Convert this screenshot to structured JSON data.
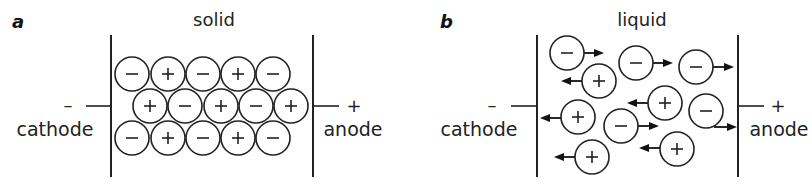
{
  "panels": [
    {
      "id": "a",
      "label": "a",
      "title": "solid",
      "left_terminal": {
        "sign": "–",
        "name": "cathode"
      },
      "right_terminal": {
        "sign": "+",
        "name": "anode"
      },
      "geometry": {
        "left_wall_x": 111,
        "right_wall_x": 313,
        "wall_top": 35,
        "wall_bottom": 177,
        "lead_y": 106
      },
      "ions": [
        {
          "charge": "-",
          "x": 132,
          "y": 74
        },
        {
          "charge": "+",
          "x": 168,
          "y": 74
        },
        {
          "charge": "-",
          "x": 203,
          "y": 74
        },
        {
          "charge": "+",
          "x": 238,
          "y": 74
        },
        {
          "charge": "-",
          "x": 273,
          "y": 74
        },
        {
          "charge": "+",
          "x": 150,
          "y": 106
        },
        {
          "charge": "-",
          "x": 185,
          "y": 106
        },
        {
          "charge": "+",
          "x": 221,
          "y": 106
        },
        {
          "charge": "-",
          "x": 256,
          "y": 106
        },
        {
          "charge": "+",
          "x": 291,
          "y": 106
        },
        {
          "charge": "-",
          "x": 132,
          "y": 138
        },
        {
          "charge": "+",
          "x": 168,
          "y": 138
        },
        {
          "charge": "-",
          "x": 203,
          "y": 138
        },
        {
          "charge": "+",
          "x": 238,
          "y": 138
        },
        {
          "charge": "-",
          "x": 273,
          "y": 138
        }
      ]
    },
    {
      "id": "b",
      "label": "b",
      "title": "liquid",
      "left_terminal": {
        "sign": "–",
        "name": "cathode"
      },
      "right_terminal": {
        "sign": "+",
        "name": "anode"
      },
      "geometry": {
        "left_wall_x": 537,
        "right_wall_x": 738,
        "wall_top": 35,
        "wall_bottom": 177,
        "lead_y": 106
      },
      "ions": [
        {
          "charge": "-",
          "x": 567,
          "y": 53,
          "arrow": {
            "x1": 584,
            "y1": 53,
            "x2": 604,
            "y2": 53
          }
        },
        {
          "charge": "+",
          "x": 599,
          "y": 81,
          "arrow": {
            "x1": 582,
            "y1": 81,
            "x2": 561,
            "y2": 81
          }
        },
        {
          "charge": "-",
          "x": 636,
          "y": 63,
          "arrow": {
            "x1": 653,
            "y1": 63,
            "x2": 673,
            "y2": 63
          }
        },
        {
          "charge": "-",
          "x": 696,
          "y": 67,
          "arrow": {
            "x1": 713,
            "y1": 67,
            "x2": 734,
            "y2": 67
          }
        },
        {
          "charge": "+",
          "x": 665,
          "y": 103,
          "arrow": {
            "x1": 648,
            "y1": 103,
            "x2": 627,
            "y2": 103
          }
        },
        {
          "charge": "+",
          "x": 578,
          "y": 117,
          "arrow": {
            "x1": 561,
            "y1": 118,
            "x2": 540,
            "y2": 118
          }
        },
        {
          "charge": "-",
          "x": 621,
          "y": 126,
          "arrow": {
            "x1": 638,
            "y1": 126,
            "x2": 659,
            "y2": 126
          }
        },
        {
          "charge": "-",
          "x": 706,
          "y": 111,
          "arrow": {
            "x1": 714,
            "y1": 127,
            "x2": 737,
            "y2": 127
          }
        },
        {
          "charge": "+",
          "x": 677,
          "y": 149,
          "arrow": {
            "x1": 660,
            "y1": 148,
            "x2": 639,
            "y2": 148
          }
        },
        {
          "charge": "+",
          "x": 592,
          "y": 157,
          "arrow": {
            "x1": 575,
            "y1": 157,
            "x2": 554,
            "y2": 157
          }
        }
      ]
    }
  ],
  "style": {
    "stroke": "#222222",
    "background": "#ffffff",
    "ion_radius": 17
  }
}
